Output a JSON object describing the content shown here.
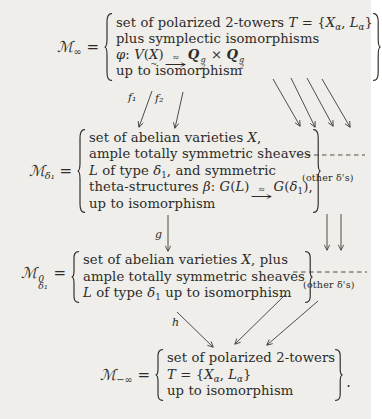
{
  "background": "#efeeea",
  "ink": "#2d2b28",
  "nodes": [
    {
      "id": "m-infinity",
      "label": [
        {
          "t": "ℳ",
          "s": "scr"
        },
        {
          "t": "∞",
          "s": "sub"
        },
        {
          "t": " ="
        }
      ],
      "lines": [
        [
          {
            "t": "set of polarized 2-towers "
          },
          {
            "t": "T",
            "s": "scr"
          },
          {
            "t": " = {"
          },
          {
            "t": "X",
            "s": "i"
          },
          {
            "t": "α",
            "s": "subi"
          },
          {
            "t": ", "
          },
          {
            "t": "L",
            "s": "i"
          },
          {
            "t": "α",
            "s": "subi"
          },
          {
            "t": "}"
          }
        ],
        [
          {
            "t": "plus symplectic isomorphisms"
          }
        ],
        [
          {
            "t": "φ",
            "s": "i"
          },
          {
            "t": ": "
          },
          {
            "t": "V",
            "s": "i"
          },
          {
            "t": "("
          },
          {
            "t": "X",
            "m": "~",
            "s": "utilde"
          },
          {
            "t": ")"
          },
          {
            "t": "≈",
            "a": "→",
            "s": "xarrow"
          },
          {
            "t": "Q",
            "s": "bi"
          },
          {
            "sup": "g",
            "sub": "2",
            "s": "stack"
          },
          {
            "t": " × "
          },
          {
            "t": "Q",
            "s": "bi"
          },
          {
            "sup": "g",
            "sub": "2",
            "s": "stack"
          }
        ],
        [
          {
            "t": "up to isomorphism"
          }
        ]
      ]
    },
    {
      "id": "m-delta1",
      "label": [
        {
          "t": "ℳ",
          "s": "scr"
        },
        {
          "t": "δ₁",
          "s": "subi"
        },
        {
          "t": " ="
        }
      ],
      "lines": [
        [
          {
            "t": "set of abelian varieties "
          },
          {
            "t": "X",
            "s": "i"
          },
          {
            "t": ","
          }
        ],
        [
          {
            "t": "ample totally symmetric sheaves"
          }
        ],
        [
          {
            "t": "L",
            "s": "i"
          },
          {
            "t": " of type "
          },
          {
            "t": "δ",
            "s": "i"
          },
          {
            "t": "1",
            "s": "sub"
          },
          {
            "t": ", and symmetric"
          }
        ],
        [
          {
            "t": "theta-structures "
          },
          {
            "t": "β",
            "s": "i"
          },
          {
            "t": ": "
          },
          {
            "t": "G",
            "s": "scr"
          },
          {
            "t": "("
          },
          {
            "t": "L",
            "s": "i"
          },
          {
            "t": ")"
          },
          {
            "t": "≈",
            "a": "→",
            "s": "xarrow"
          },
          {
            "t": "G",
            "s": "scr"
          },
          {
            "t": "("
          },
          {
            "t": "δ",
            "s": "i"
          },
          {
            "t": "1",
            "s": "sub"
          },
          {
            "t": "),"
          }
        ],
        [
          {
            "t": "up to isomorphism"
          }
        ]
      ]
    },
    {
      "id": "m0-delta1",
      "label": [
        {
          "t": "ℳ",
          "s": "scr"
        },
        {
          "sup": "0",
          "sub": "δ₁",
          "s": "stack"
        },
        {
          "t": " ="
        }
      ],
      "lines": [
        [
          {
            "t": "set of abelian varieties "
          },
          {
            "t": "X",
            "s": "i"
          },
          {
            "t": ", plus"
          }
        ],
        [
          {
            "t": "ample totally symmetric sheaves"
          }
        ],
        [
          {
            "t": "L",
            "s": "i"
          },
          {
            "t": " of type "
          },
          {
            "t": "δ",
            "s": "i"
          },
          {
            "t": "1",
            "s": "sub"
          },
          {
            "t": " up to isomorphism"
          }
        ]
      ]
    },
    {
      "id": "m-minus-infinity",
      "label": [
        {
          "t": "ℳ",
          "s": "scr"
        },
        {
          "t": "−∞",
          "s": "sub"
        },
        {
          "t": " ="
        }
      ],
      "lines": [
        [
          {
            "t": "set of polarized 2-towers"
          }
        ],
        [
          {
            "t": "T",
            "s": "scr"
          },
          {
            "t": " = {"
          },
          {
            "t": "X",
            "s": "i"
          },
          {
            "t": "α",
            "s": "subi"
          },
          {
            "t": ", "
          },
          {
            "t": "L",
            "s": "i"
          },
          {
            "t": "α",
            "s": "subi"
          },
          {
            "t": "}"
          }
        ],
        [
          {
            "t": "up to isomorphism"
          }
        ]
      ]
    }
  ],
  "morphisms": {
    "f1": "f₁",
    "f2": "f₂",
    "g": "g",
    "h": "h"
  },
  "side_notes": [
    {
      "text": "(other δ's)"
    },
    {
      "text": "(other δ's)"
    }
  ],
  "trailing_period": "."
}
